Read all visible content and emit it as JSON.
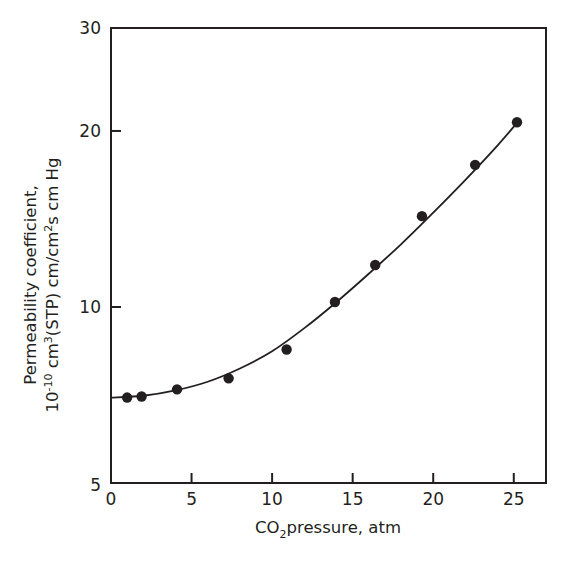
{
  "chart_data": {
    "type": "line",
    "title": "",
    "xlabel": "CO2 pressure, atm",
    "xlabel_parts": {
      "main": "CO",
      "sub": "2",
      "rest": "pressure, atm"
    },
    "ylabel": "Permeability coefficient, 10^-10 cm3(STP) cm/cm2s cm Hg",
    "ylabel_lines": {
      "line1": "Permeability coefficient,",
      "line2_parts": {
        "a": "10",
        "a_sup": "-10",
        "b": " cm",
        "b_sup": "3",
        "c": "(STP) cm/cm",
        "c_sup": "2",
        "d": "s cm Hg"
      }
    },
    "xlim": [
      0,
      27
    ],
    "ylim": [
      5,
      30
    ],
    "yscale": "log",
    "grid": false,
    "legend": null,
    "x_ticks": [
      0,
      5,
      10,
      15,
      20,
      25
    ],
    "x_tick_labels": [
      "0",
      "5",
      "10",
      "15",
      "20",
      "25"
    ],
    "y_ticks": [
      5,
      10,
      20,
      30
    ],
    "y_tick_labels": [
      "5",
      "10",
      "20",
      "30"
    ],
    "series": [
      {
        "name": "Measured data",
        "style": "markers",
        "marker": "filled-circle",
        "x": [
          1.0,
          1.9,
          4.1,
          7.3,
          10.9,
          13.9,
          16.4,
          19.3,
          22.6,
          25.2
        ],
        "values": [
          7.0,
          7.03,
          7.23,
          7.55,
          8.46,
          10.2,
          11.8,
          14.3,
          17.5,
          20.7
        ]
      },
      {
        "name": "Fitted curve",
        "style": "line",
        "x": [
          0,
          2,
          4,
          6,
          8,
          10,
          12,
          14,
          16,
          18,
          20,
          22,
          24,
          25.3
        ],
        "values": [
          7.0,
          7.05,
          7.2,
          7.45,
          7.85,
          8.4,
          9.2,
          10.2,
          11.4,
          12.8,
          14.5,
          16.5,
          18.9,
          20.8
        ]
      }
    ],
    "colors": {
      "ink": "#231f20",
      "background": "#ffffff"
    }
  }
}
